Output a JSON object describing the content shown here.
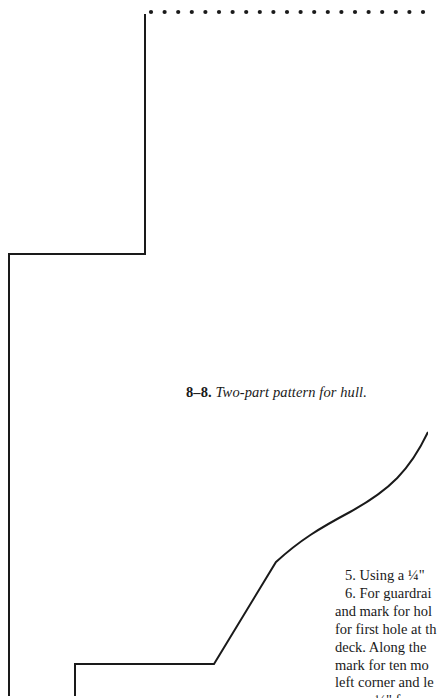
{
  "figure": {
    "number": "8–8.",
    "title": "Two-part pattern for hull.",
    "dotted_fold_line": {
      "y": 12,
      "x_start": 151,
      "x_end": 428,
      "spacing": 13.6
    },
    "outline_color": "#1a1a1a"
  },
  "body_text": {
    "lines": [
      "5. Using a ¼\"",
      "6. For guardrai",
      "and mark for hol",
      "for first hole at th",
      "deck. Along the",
      "mark for ten mo",
      "left corner and le",
      "¼\" f"
    ]
  }
}
